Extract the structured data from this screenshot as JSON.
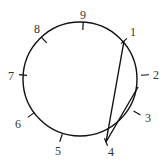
{
  "diagram": {
    "type": "circle-with-chords",
    "stroke_color": "#111111",
    "label_color": "#333333",
    "circle": {
      "cx": 80,
      "cy": 79,
      "r": 57
    },
    "points": [
      {
        "label": "9",
        "x": 83,
        "y": 26,
        "lx": 83,
        "ly": 19
      },
      {
        "label": "1",
        "x": 124,
        "y": 41,
        "lx": 133,
        "ly": 36
      },
      {
        "label": "2",
        "x": 145,
        "y": 75,
        "lx": 156,
        "ly": 79
      },
      {
        "label": "3",
        "x": 137,
        "y": 113,
        "lx": 148,
        "ly": 122
      },
      {
        "label": "4",
        "x": 106,
        "y": 142,
        "lx": 111,
        "ly": 156
      },
      {
        "label": "5",
        "x": 61,
        "y": 138,
        "lx": 58,
        "ly": 155
      },
      {
        "label": "6",
        "x": 31,
        "y": 115,
        "lx": 18,
        "ly": 128
      },
      {
        "label": "7",
        "x": 23,
        "y": 75,
        "lx": 11,
        "ly": 80
      },
      {
        "label": "8",
        "x": 44,
        "y": 40,
        "lx": 37,
        "ly": 33
      }
    ],
    "chords": [
      {
        "from": "4",
        "to": "1",
        "x1": 106,
        "y1": 142,
        "x2": 124,
        "y2": 41
      },
      {
        "from": "4",
        "to": "interior",
        "x1": 106,
        "y1": 142,
        "x2": 138,
        "y2": 87
      }
    ]
  }
}
